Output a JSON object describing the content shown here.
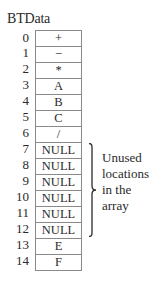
{
  "title": "BTData",
  "array": {
    "indices": [
      "0",
      "1",
      "2",
      "3",
      "4",
      "5",
      "6",
      "7",
      "8",
      "9",
      "10",
      "11",
      "12",
      "13",
      "14"
    ],
    "values": [
      "+",
      "−",
      "*",
      "A",
      "B",
      "C",
      "/",
      "NULL",
      "NULL",
      "NULL",
      "NULL",
      "NULL",
      "NULL",
      "E",
      "F"
    ]
  },
  "annotation": {
    "lines": [
      "Unused",
      "locations",
      "in the",
      "array"
    ],
    "spans_indices": [
      7,
      12
    ]
  },
  "colors": {
    "text": "#2a2a2a",
    "border": "#8a8a8a",
    "background": "#ffffff"
  }
}
